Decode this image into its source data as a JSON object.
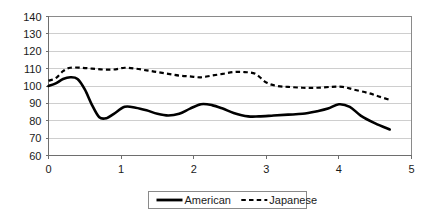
{
  "chart_data": {
    "type": "line",
    "title": "",
    "subtitle": "",
    "xlabel": "",
    "ylabel": "",
    "xlim": [
      0,
      5
    ],
    "ylim": [
      60,
      140
    ],
    "xticks": [
      "0",
      "1",
      "2",
      "3",
      "4",
      "5"
    ],
    "xtick_values": [
      0,
      1,
      2,
      3,
      4,
      5
    ],
    "yticks": [
      "60",
      "70",
      "80",
      "90",
      "100",
      "110",
      "120",
      "130",
      "140"
    ],
    "ytick_values": [
      60,
      70,
      80,
      90,
      100,
      110,
      120,
      130,
      140
    ],
    "grid": "horizontal",
    "legend_position": "bottom-center",
    "series": [
      {
        "name": "American",
        "style": "solid",
        "color": "#000000",
        "x": [
          0.0,
          0.1,
          0.2,
          0.3,
          0.4,
          0.5,
          0.6,
          0.7,
          0.8,
          0.9,
          1.05,
          1.2,
          1.35,
          1.5,
          1.65,
          1.8,
          1.95,
          2.1,
          2.25,
          2.4,
          2.55,
          2.75,
          2.9,
          3.1,
          3.3,
          3.5,
          3.7,
          3.85,
          4.0,
          4.15,
          4.3,
          4.5,
          4.7
        ],
        "values": [
          100.0,
          101.5,
          104.0,
          105.0,
          104.0,
          98.0,
          89.0,
          82.0,
          81.5,
          84.0,
          88.0,
          87.5,
          86.0,
          84.0,
          83.0,
          84.0,
          87.0,
          89.5,
          89.0,
          87.0,
          84.5,
          82.5,
          82.5,
          83.0,
          83.5,
          84.0,
          85.5,
          87.0,
          89.5,
          88.0,
          83.0,
          78.5,
          75.0
        ]
      },
      {
        "name": "Japanese",
        "style": "dashed",
        "color": "#000000",
        "x": [
          0.0,
          0.1,
          0.2,
          0.3,
          0.45,
          0.6,
          0.75,
          0.9,
          1.05,
          1.2,
          1.35,
          1.5,
          1.65,
          1.8,
          1.95,
          2.1,
          2.25,
          2.4,
          2.55,
          2.7,
          2.85,
          3.0,
          3.15,
          3.3,
          3.5,
          3.7,
          3.9,
          4.05,
          4.2,
          4.4,
          4.55,
          4.7
        ],
        "values": [
          103.0,
          104.5,
          108.5,
          110.5,
          110.5,
          110.0,
          109.5,
          109.5,
          110.5,
          110.0,
          109.0,
          108.0,
          107.0,
          106.0,
          105.5,
          105.0,
          106.0,
          107.0,
          108.0,
          108.0,
          107.0,
          102.0,
          100.0,
          99.5,
          99.0,
          99.0,
          99.5,
          99.5,
          98.0,
          96.0,
          94.0,
          92.0
        ]
      }
    ]
  },
  "legend": {
    "items": [
      {
        "label": "American",
        "style": "solid"
      },
      {
        "label": "Japanese",
        "style": "dashed"
      }
    ]
  },
  "colors": {
    "background": "#ffffff",
    "grid": "#b9b9b9",
    "axis": "#6e6e6e",
    "frame": "#8a8a8a",
    "ink": "#000000"
  }
}
